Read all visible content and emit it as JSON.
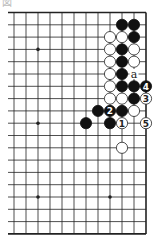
{
  "diagram": {
    "caption": "図",
    "board_size": 19,
    "visible_cols": [
      7,
      18
    ],
    "visible_rows": [
      0,
      18
    ],
    "geometry": {
      "origin_x": 146,
      "origin_y": 12.5,
      "dx": 12.0,
      "dy": 12.3,
      "left_clip_x": 8,
      "stone_r": 5.6
    },
    "colors": {
      "line": "#222222",
      "black": "#111111",
      "white_fill": "#ffffff",
      "white_stroke": "#222222",
      "label_on_black": "#ffffff",
      "label_on_white": "#222222"
    },
    "hoshi": [
      {
        "col": 9,
        "row": 3
      },
      {
        "col": 15,
        "row": 3
      },
      {
        "col": 9,
        "row": 9
      },
      {
        "col": 15,
        "row": 9
      },
      {
        "col": 9,
        "row": 15
      },
      {
        "col": 15,
        "row": 15
      }
    ],
    "stones": [
      {
        "color": "black",
        "col": 16,
        "row": 1
      },
      {
        "color": "black",
        "col": 17,
        "row": 1
      },
      {
        "color": "white",
        "col": 15,
        "row": 2
      },
      {
        "color": "white",
        "col": 16,
        "row": 2
      },
      {
        "color": "black",
        "col": 17,
        "row": 2
      },
      {
        "color": "white",
        "col": 15,
        "row": 3
      },
      {
        "color": "black",
        "col": 16,
        "row": 3
      },
      {
        "color": "white",
        "col": 17,
        "row": 3
      },
      {
        "color": "white",
        "col": 15,
        "row": 4
      },
      {
        "color": "black",
        "col": 16,
        "row": 4
      },
      {
        "color": "white",
        "col": 17,
        "row": 4
      },
      {
        "color": "white",
        "col": 15,
        "row": 5
      },
      {
        "color": "black",
        "col": 16,
        "row": 5
      },
      {
        "color": "white",
        "col": 15,
        "row": 6
      },
      {
        "color": "black",
        "col": 16,
        "row": 6
      },
      {
        "color": "black",
        "col": 17,
        "row": 6
      },
      {
        "color": "black",
        "col": 18,
        "row": 6,
        "label": "4"
      },
      {
        "color": "white",
        "col": 15,
        "row": 7
      },
      {
        "color": "white",
        "col": 16,
        "row": 7
      },
      {
        "color": "black",
        "col": 17,
        "row": 7
      },
      {
        "color": "white",
        "col": 18,
        "row": 7,
        "label": "3"
      },
      {
        "color": "black",
        "col": 14,
        "row": 8
      },
      {
        "color": "black",
        "col": 15,
        "row": 8,
        "label": "2"
      },
      {
        "color": "black",
        "col": 16,
        "row": 8
      },
      {
        "color": "white",
        "col": 17,
        "row": 8
      },
      {
        "color": "black",
        "col": 13,
        "row": 9
      },
      {
        "color": "black",
        "col": 15,
        "row": 9
      },
      {
        "color": "white",
        "col": 16,
        "row": 9,
        "label": "1"
      },
      {
        "color": "white",
        "col": 18,
        "row": 9,
        "label": "5"
      },
      {
        "color": "white",
        "col": 16,
        "row": 11
      }
    ],
    "point_labels": [
      {
        "text": "a",
        "col": 17,
        "row": 5
      }
    ]
  }
}
